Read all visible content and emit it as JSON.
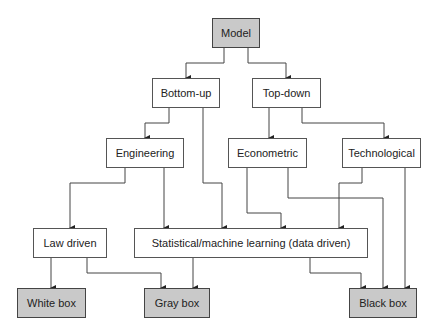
{
  "diagram": {
    "nodes": {
      "model": "Model",
      "bottom_up": "Bottom-up",
      "top_down": "Top-down",
      "engineering": "Engineering",
      "econometric": "Econometric",
      "technological": "Technological",
      "law_driven": "Law driven",
      "statistical": "Statistical/machine learning (data driven)",
      "white_box": "White box",
      "gray_box": "Gray box",
      "black_box": "Black box"
    },
    "edges": [
      [
        "Model",
        "Bottom-up"
      ],
      [
        "Model",
        "Top-down"
      ],
      [
        "Bottom-up",
        "Engineering"
      ],
      [
        "Bottom-up",
        "Statistical/machine learning (data driven)"
      ],
      [
        "Top-down",
        "Econometric"
      ],
      [
        "Top-down",
        "Technological"
      ],
      [
        "Engineering",
        "Law driven"
      ],
      [
        "Engineering",
        "Statistical/machine learning (data driven)"
      ],
      [
        "Econometric",
        "Statistical/machine learning (data driven)"
      ],
      [
        "Econometric",
        "Black box"
      ],
      [
        "Technological",
        "Statistical/machine learning (data driven)"
      ],
      [
        "Technological",
        "Black box"
      ],
      [
        "Law driven",
        "White box"
      ],
      [
        "Law driven",
        "Gray box"
      ],
      [
        "Statistical/machine learning (data driven)",
        "Gray box"
      ],
      [
        "Statistical/machine learning (data driven)",
        "Black box"
      ]
    ],
    "colors": {
      "leaf_fill": "#c9c9c9",
      "node_fill": "#ffffff",
      "line": "#333333"
    }
  }
}
